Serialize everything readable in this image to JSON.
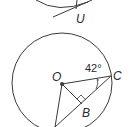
{
  "diagram": {
    "top_figure": {
      "point_label": "U"
    },
    "main_figure": {
      "center_label": "O",
      "point_c_label": "C",
      "point_b_label": "B",
      "angle_label": "42°",
      "right_angle_at": "B"
    },
    "colors": {
      "stroke": "#3a3a3a",
      "background": "#ffffff"
    }
  }
}
